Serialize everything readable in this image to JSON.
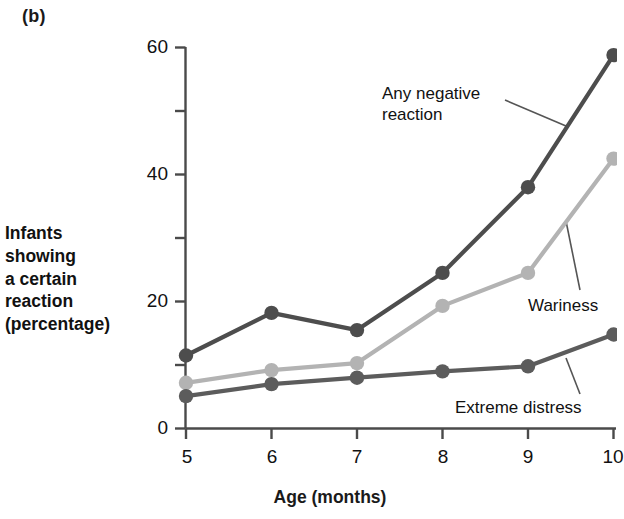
{
  "figure": {
    "panel_letter": "(b)",
    "y_axis_title_lines": [
      "Infants",
      "showing",
      "a certain",
      "reaction",
      "(percentage)"
    ],
    "x_axis_title": "Age (months)"
  },
  "chart_data": {
    "type": "line",
    "title": "",
    "xlabel": "Age (months)",
    "ylabel": "Infants showing a certain reaction (percentage)",
    "x": [
      5,
      6,
      7,
      8,
      9,
      10
    ],
    "xtick_labels": [
      "5",
      "6",
      "7",
      "8",
      "9",
      "10"
    ],
    "ytick_labels": [
      "0",
      "20",
      "40",
      "60"
    ],
    "ytick_values": [
      0,
      20,
      40,
      60
    ],
    "yminor_values": [
      10,
      30,
      50
    ],
    "xlim": [
      5,
      10
    ],
    "ylim": [
      0,
      60
    ],
    "grid": false,
    "legend": "annotations-on-plot",
    "series": [
      {
        "name": "Any negative reaction",
        "color": "#4d4d4d",
        "values": [
          11.5,
          18.2,
          15.5,
          24.5,
          38.0,
          58.8
        ]
      },
      {
        "name": "Wariness",
        "color": "#b3b3b3",
        "values": [
          7.2,
          9.2,
          10.3,
          19.3,
          24.5,
          42.5
        ]
      },
      {
        "name": "Extreme distress",
        "color": "#5c5c5c",
        "values": [
          5.1,
          7.0,
          8.0,
          9.0,
          9.8,
          14.8
        ]
      }
    ],
    "annotations": [
      {
        "text_lines": [
          "Any negative",
          "reaction"
        ],
        "target_series": "Any negative reaction"
      },
      {
        "text_lines": [
          "Wariness"
        ],
        "target_series": "Wariness"
      },
      {
        "text_lines": [
          "Extreme distress"
        ],
        "target_series": "Extreme distress"
      }
    ]
  },
  "colors": {
    "axis": "#4a4a4a",
    "text": "#111111",
    "background": "#ffffff",
    "series_dark": "#4d4d4d",
    "series_light": "#b3b3b3",
    "series_medium": "#5c5c5c"
  }
}
